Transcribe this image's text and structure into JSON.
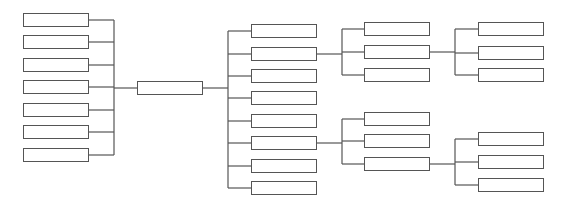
{
  "diagram": {
    "type": "tree",
    "line_color": "#555555",
    "box_border_color": "#555555",
    "root": {
      "id": "root",
      "label": "",
      "x": 137,
      "y": 81
    },
    "left_children": [
      {
        "id": "L1",
        "label": "",
        "x": 23,
        "y": 13
      },
      {
        "id": "L2",
        "label": "",
        "x": 23,
        "y": 35
      },
      {
        "id": "L3",
        "label": "",
        "x": 23,
        "y": 58
      },
      {
        "id": "L4",
        "label": "",
        "x": 23,
        "y": 80
      },
      {
        "id": "L5",
        "label": "",
        "x": 23,
        "y": 103
      },
      {
        "id": "L6",
        "label": "",
        "x": 23,
        "y": 125
      },
      {
        "id": "L7",
        "label": "",
        "x": 23,
        "y": 148
      }
    ],
    "middle_children": [
      {
        "id": "M1",
        "label": "",
        "x": 251,
        "y": 24
      },
      {
        "id": "M2",
        "label": "",
        "x": 251,
        "y": 47
      },
      {
        "id": "M3",
        "label": "",
        "x": 251,
        "y": 69
      },
      {
        "id": "M4",
        "label": "",
        "x": 251,
        "y": 91
      },
      {
        "id": "M5",
        "label": "",
        "x": 251,
        "y": 114
      },
      {
        "id": "M6",
        "label": "",
        "x": 251,
        "y": 136
      },
      {
        "id": "M7",
        "label": "",
        "x": 251,
        "y": 159
      },
      {
        "id": "M8",
        "label": "",
        "x": 251,
        "y": 181
      }
    ],
    "m2_children": [
      {
        "id": "A1",
        "label": "",
        "x": 364,
        "y": 22
      },
      {
        "id": "A2",
        "label": "",
        "x": 364,
        "y": 45
      },
      {
        "id": "A3",
        "label": "",
        "x": 364,
        "y": 68
      }
    ],
    "a2_children": [
      {
        "id": "B1",
        "label": "",
        "x": 478,
        "y": 22
      },
      {
        "id": "B2",
        "label": "",
        "x": 478,
        "y": 46
      },
      {
        "id": "B3",
        "label": "",
        "x": 478,
        "y": 68
      }
    ],
    "m6_children": [
      {
        "id": "C1",
        "label": "",
        "x": 364,
        "y": 112
      },
      {
        "id": "C2",
        "label": "",
        "x": 364,
        "y": 134
      },
      {
        "id": "C3",
        "label": "",
        "x": 364,
        "y": 157
      }
    ],
    "c3_children": [
      {
        "id": "D1",
        "label": "",
        "x": 478,
        "y": 132
      },
      {
        "id": "D2",
        "label": "",
        "x": 478,
        "y": 155
      },
      {
        "id": "D3",
        "label": "",
        "x": 478,
        "y": 178
      }
    ]
  }
}
